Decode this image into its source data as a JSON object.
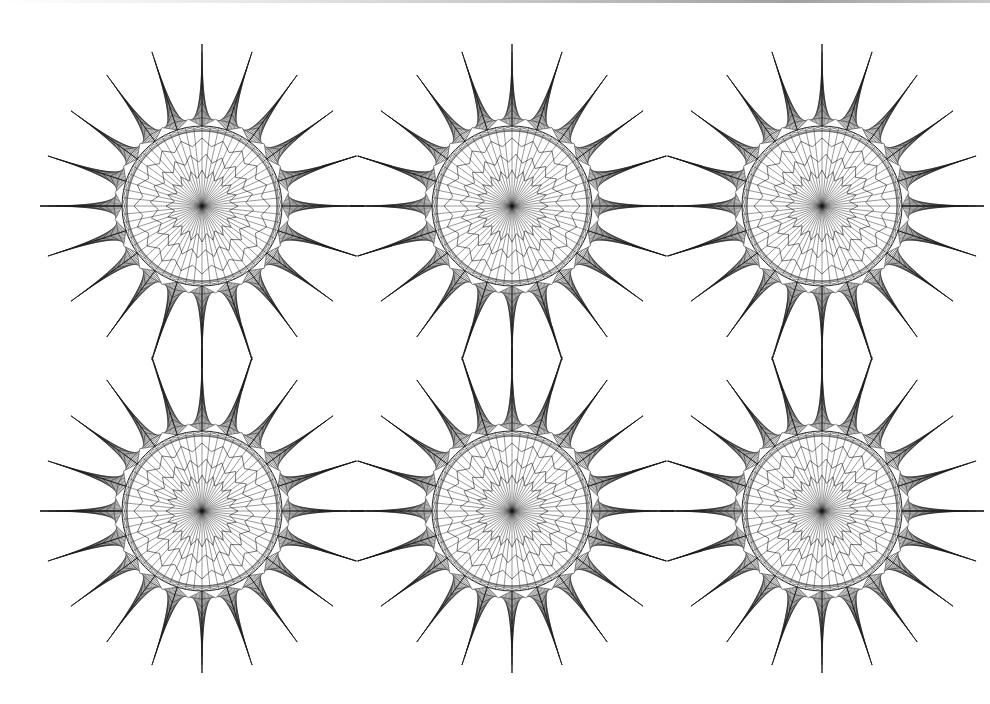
{
  "canvas": {
    "width": 990,
    "height": 704,
    "background": "#ffffff",
    "ink": "#1a1a1a"
  },
  "pattern": {
    "type": "curve-stitch-star-grid",
    "rows": 2,
    "cols": 3,
    "centers_x": [
      202,
      512,
      822
    ],
    "centers_y": [
      206,
      511
    ],
    "star": {
      "points": 20,
      "inner_radius": 80,
      "valley_radius": 88,
      "tip_radius": 162,
      "spoke_count": 60,
      "stitch_lines_per_spike": 10
    },
    "connectors": {
      "horizontal_gap_lines": true,
      "vertical_gap_lines": true
    }
  }
}
